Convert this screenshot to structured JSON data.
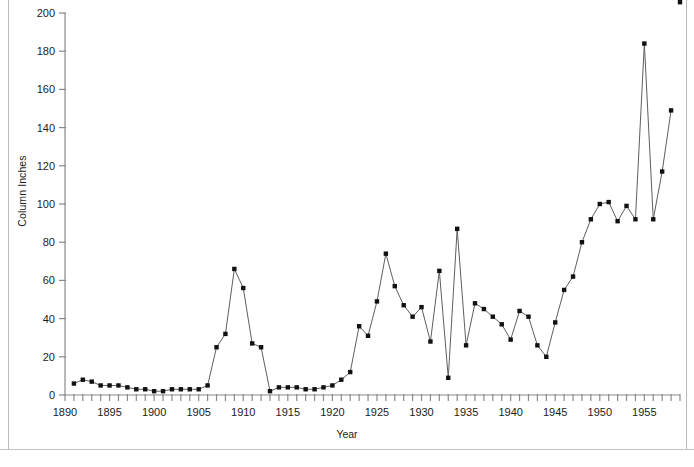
{
  "chart_data": {
    "type": "line",
    "title": "",
    "xlabel": "Year",
    "ylabel": "Column Inches",
    "xlim": [
      1890,
      1959
    ],
    "ylim": [
      0,
      200
    ],
    "ytick_step": 20,
    "xtick_step": 1,
    "xlabel_step": 5,
    "grid": false,
    "legend": null,
    "marker": "square",
    "yticks": [
      0,
      20,
      40,
      60,
      80,
      100,
      120,
      140,
      160,
      180,
      200
    ],
    "xticklabels": [
      1890,
      1895,
      1900,
      1905,
      1910,
      1915,
      1920,
      1925,
      1930,
      1935,
      1940,
      1945,
      1950,
      1955
    ],
    "x": [
      1891,
      1892,
      1893,
      1894,
      1895,
      1896,
      1897,
      1898,
      1899,
      1900,
      1901,
      1902,
      1903,
      1904,
      1905,
      1906,
      1907,
      1908,
      1909,
      1910,
      1911,
      1912,
      1913,
      1914,
      1915,
      1916,
      1917,
      1918,
      1919,
      1920,
      1921,
      1922,
      1923,
      1924,
      1925,
      1926,
      1927,
      1928,
      1929,
      1930,
      1931,
      1932,
      1933,
      1934,
      1935,
      1936,
      1937,
      1938,
      1939,
      1940,
      1941,
      1942,
      1943,
      1944,
      1945,
      1946,
      1947,
      1948,
      1949,
      1950,
      1951,
      1952,
      1953,
      1954,
      1955,
      1956,
      1957,
      1958,
      1959
    ],
    "y": [
      6,
      8,
      7,
      5,
      5,
      5,
      4,
      3,
      3,
      2,
      2,
      3,
      3,
      3,
      3,
      5,
      25,
      32,
      66,
      56,
      27,
      25,
      2,
      4,
      4,
      4,
      3,
      3,
      4,
      5,
      8,
      12,
      36,
      31,
      49,
      74,
      57,
      47,
      41,
      46,
      28,
      65,
      9,
      87,
      26,
      48,
      45,
      41,
      37,
      29,
      44,
      41,
      26,
      20,
      38,
      55,
      62,
      80,
      92,
      100,
      101,
      91,
      99,
      92,
      184,
      92,
      117,
      149
    ]
  }
}
